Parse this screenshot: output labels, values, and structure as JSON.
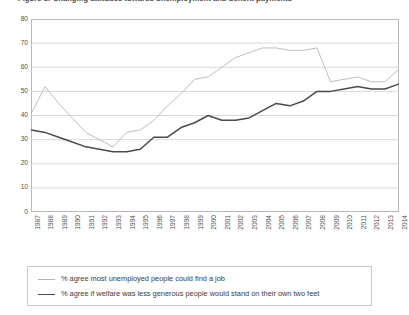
{
  "figure": {
    "title_clipped": "Figure 3: Changing attitudes towards unemployment and benefit payments",
    "background": "#ffffff"
  },
  "chart_data": {
    "type": "line",
    "title": "Figure 3: Changing attitudes towards unemployment and benefit payments",
    "xlabel": "",
    "ylabel": "",
    "ylim": [
      0,
      80
    ],
    "ytick_step": 10,
    "yticks": [
      80,
      70,
      60,
      50,
      40,
      30,
      20,
      10,
      0
    ],
    "grid": true,
    "grid_axis": "y",
    "legend_position": "below",
    "categories": [
      "1987",
      "1988",
      "1989",
      "1990",
      "1991",
      "1992",
      "1993",
      "1994",
      "1995",
      "1996",
      "1997",
      "1998",
      "1999",
      "2000",
      "2001",
      "2002",
      "2003",
      "2004",
      "2005",
      "2006",
      "2007",
      "2008",
      "2009",
      "2010",
      "2011",
      "2012",
      "2013",
      "2014"
    ],
    "series": [
      {
        "name": "% agree most unemployed people could find a job",
        "color": "#b5b5b5",
        "values": [
          41,
          52,
          45,
          39,
          33,
          30,
          27,
          33,
          34,
          38,
          44,
          49,
          55,
          56,
          60,
          64,
          66,
          68,
          68,
          67,
          67,
          68,
          54,
          55,
          56,
          54,
          54,
          59
        ]
      },
      {
        "name": "% agree if welfare was less generous people would stand on their own two feet",
        "color": "#4a4a4a",
        "values": [
          34,
          33,
          31,
          29,
          27,
          26,
          25,
          25,
          26,
          31,
          31,
          35,
          37,
          40,
          38,
          38,
          39,
          42,
          45,
          44,
          46,
          50,
          50,
          51,
          52,
          51,
          51,
          53
        ]
      }
    ]
  },
  "legend": {
    "items": [
      {
        "label": "% agree most unemployed people could find a job",
        "color": "#b5b5b5",
        "width": "1.1px"
      },
      {
        "label": "% agree if welfare was less generous people would stand on their own two feet",
        "color": "#4a4a4a",
        "width": "1.7px"
      }
    ]
  }
}
